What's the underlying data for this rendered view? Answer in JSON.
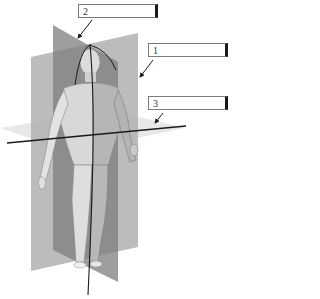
{
  "figure": {
    "labels": [
      {
        "id": "label-2",
        "number": "2",
        "value": "",
        "x": 78,
        "y": 4,
        "w": 80
      },
      {
        "id": "label-1",
        "number": "1",
        "value": "",
        "x": 148,
        "y": 43,
        "w": 80
      },
      {
        "id": "label-3",
        "number": "3",
        "value": "",
        "x": 148,
        "y": 96,
        "w": 80
      }
    ],
    "arrows": [
      {
        "for": "2",
        "x1": 92,
        "y1": 20,
        "x2": 78,
        "y2": 38
      },
      {
        "for": "1",
        "x1": 153,
        "y1": 60,
        "x2": 140,
        "y2": 77
      },
      {
        "for": "3",
        "x1": 163,
        "y1": 113,
        "x2": 155,
        "y2": 123
      }
    ],
    "planes": [
      {
        "name": "sagittal-plane",
        "color": "#8c8c8c"
      },
      {
        "name": "coronal-plane",
        "color": "#a6a6a6"
      },
      {
        "name": "transverse-plane",
        "color": "#e4e4e4"
      }
    ],
    "colors": {
      "line": "#1a1a1a",
      "skin_light": "#e8e8e8",
      "skin_shadow": "#9a9a9a"
    }
  }
}
